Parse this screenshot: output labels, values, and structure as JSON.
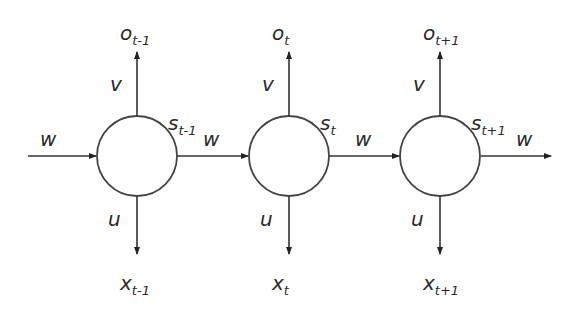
{
  "diagram": {
    "input_weight_label": "w",
    "output_weight_label": "w",
    "nodes": [
      {
        "state": "s",
        "state_sub": "t-1",
        "output": "o",
        "output_sub": "t-1",
        "input": "x",
        "input_sub": "t-1",
        "v": "v",
        "u": "u",
        "w": "w"
      },
      {
        "state": "s",
        "state_sub": "t",
        "output": "o",
        "output_sub": "t",
        "input": "x",
        "input_sub": "t",
        "v": "v",
        "u": "u",
        "w": "w"
      },
      {
        "state": "s",
        "state_sub": "t+1",
        "output": "o",
        "output_sub": "t+1",
        "input": "x",
        "input_sub": "t+1",
        "v": "v",
        "u": "u",
        "w": "w"
      }
    ]
  }
}
